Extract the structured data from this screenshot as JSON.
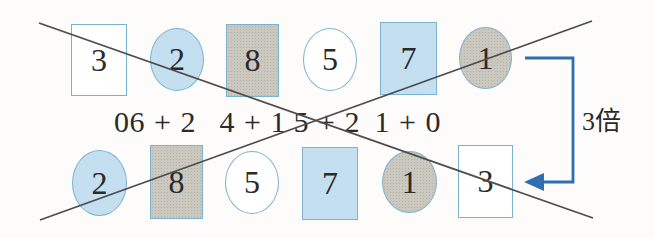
{
  "top_row": [
    {
      "shape": "square",
      "fill": "white",
      "value": "3"
    },
    {
      "shape": "ellipse",
      "fill": "blue",
      "value": "2"
    },
    {
      "shape": "square",
      "fill": "gray",
      "value": "8"
    },
    {
      "shape": "ellipse",
      "fill": "white",
      "value": "5"
    },
    {
      "shape": "square",
      "fill": "blue",
      "value": "7"
    },
    {
      "shape": "ellipse",
      "fill": "gray",
      "value": "1"
    }
  ],
  "expressions": [
    "0",
    "6 + 2",
    "4 + 1",
    "5 + 2",
    "1 + 0"
  ],
  "bottom_row": [
    {
      "shape": "ellipse",
      "fill": "blue",
      "value": "2"
    },
    {
      "shape": "square",
      "fill": "gray",
      "value": "8"
    },
    {
      "shape": "ellipse",
      "fill": "white",
      "value": "5"
    },
    {
      "shape": "square",
      "fill": "blue",
      "value": "7"
    },
    {
      "shape": "ellipse",
      "fill": "gray",
      "value": "1"
    },
    {
      "shape": "square",
      "fill": "white",
      "value": "3"
    }
  ],
  "multiplier_label": "3倍",
  "annotations": {
    "crossed_out_expression": "5 + 2",
    "cross_lines": 2
  },
  "colors": {
    "blue-fill": "#c4dff0",
    "blue-border": "#7db2cf",
    "gray-fill": "#cbc8bf",
    "gray-dot": "#b4b1a7",
    "white-fill": "#ffffff",
    "line": "#4d4d4d",
    "arrow": "#2f6fae",
    "text": "#2a2a2a",
    "background": "#fdfcfa"
  }
}
